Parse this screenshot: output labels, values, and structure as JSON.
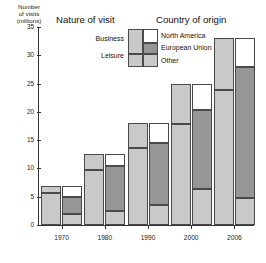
{
  "chart_data": {
    "type": "bar",
    "title": "",
    "xlabel": "",
    "ylabel": "Number of visits (millions)",
    "ylim": [
      0,
      35
    ],
    "yticks": [
      0,
      5,
      10,
      15,
      20,
      25,
      30,
      35
    ],
    "grid": false,
    "legend_position": "top-center",
    "categories": [
      "1970",
      "1980",
      "1990",
      "2000",
      "2006"
    ],
    "panels": [
      {
        "name": "Nature of visit",
        "stack_order_bottom_to_top": [
          "Leisure",
          "Business"
        ],
        "series": [
          {
            "name": "Leisure",
            "values": [
              5.6,
              9.8,
              13.7,
              17.8,
              23.8
            ]
          },
          {
            "name": "Business",
            "values": [
              1.3,
              2.7,
              4.3,
              7.2,
              9.2
            ]
          }
        ],
        "totals": [
          6.9,
          12.5,
          18.0,
          25.0,
          33.0
        ]
      },
      {
        "name": "Country of origin",
        "stack_order_bottom_to_top": [
          "Other",
          "European Union",
          "North America"
        ],
        "series": [
          {
            "name": "Other",
            "values": [
              1.9,
              2.4,
              3.6,
              6.3,
              4.7
            ]
          },
          {
            "name": "European Union",
            "values": [
              3.0,
              8.1,
              10.9,
              14.0,
              23.3
            ]
          },
          {
            "name": "North America",
            "values": [
              2.0,
              2.0,
              3.5,
              4.7,
              5.0
            ]
          }
        ],
        "totals": [
          6.9,
          12.5,
          18.0,
          25.0,
          33.0
        ]
      }
    ],
    "colors": {
      "light_gray": "#c9c9c9",
      "dark_gray": "#969696",
      "white": "#ffffff",
      "outline": "#4a4a4a",
      "axis": "#333333"
    }
  },
  "axis": {
    "y_title": "Number of visits (millions)",
    "y_title_lines": [
      "Number",
      "of visits",
      "(millions)"
    ],
    "tick_labels": [
      "35",
      "30",
      "25",
      "20",
      "15",
      "10",
      "5",
      "0"
    ],
    "x_labels": [
      "1970",
      "1980",
      "1990",
      "2000",
      "2006"
    ]
  },
  "headers": {
    "nature": "Nature of visit",
    "country": "Country of origin"
  },
  "legend": {
    "nature_items": [
      "Business",
      "Leisure"
    ],
    "country_items": [
      "North America",
      "European Union",
      "Other"
    ]
  }
}
